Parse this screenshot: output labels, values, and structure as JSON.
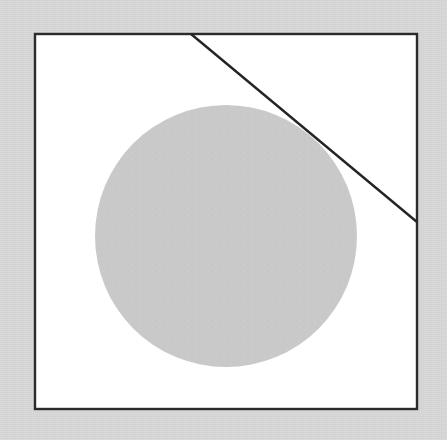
{
  "figure": {
    "title": "Circle inscribed in square with tangent line",
    "canvas": {
      "width": 447,
      "height": 440,
      "background_color": "#d4d4d4",
      "interior_color": "#ffffff"
    },
    "shapes": [
      {
        "id": "frame",
        "name": "square-frame",
        "type": "rectangle",
        "x": 35,
        "y": 34,
        "width": 382,
        "height": 375,
        "stroke_color": "#2b2b2b",
        "stroke_width": 2.4,
        "fill_color": "#ffffff",
        "label": "Square frame"
      },
      {
        "id": "circle",
        "name": "gray-circle",
        "type": "circle",
        "cx": 226,
        "cy": 236,
        "r": 131,
        "fill_color": "#c9c9c9",
        "stroke_color": "none",
        "stroke_width": 0,
        "label": "Shaded circle"
      },
      {
        "id": "tangent",
        "name": "tangent-line",
        "type": "line",
        "x1": 191,
        "y1": 34,
        "x2": 417,
        "y2": 222,
        "stroke_color": "#242424",
        "stroke_width": 2.4,
        "label": "Tangent line"
      }
    ],
    "measurements": {
      "circle_diameter": 262,
      "frame_width": 382,
      "frame_height": 375,
      "line_length": 294
    }
  }
}
